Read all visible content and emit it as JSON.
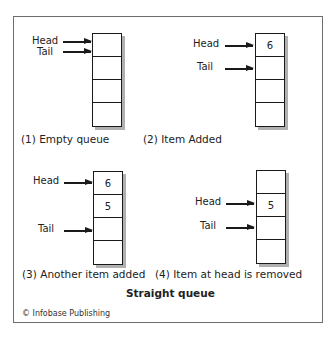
{
  "diagram": {
    "title": "Straight queue",
    "credit": "© Infobase Publishing",
    "panels": [
      {
        "caption": "(1) Empty queue",
        "head_label": "Head",
        "tail_label": "Tail",
        "cells": [
          "",
          "",
          "",
          ""
        ],
        "head_index": 0,
        "tail_index": 0
      },
      {
        "caption": "(2) Item Added",
        "head_label": "Head",
        "tail_label": "Tail",
        "cells": [
          "6",
          "",
          "",
          ""
        ],
        "head_index": 0,
        "tail_index": 1
      },
      {
        "caption": "(3) Another item added",
        "head_label": "Head",
        "tail_label": "Tail",
        "cells": [
          "6",
          "5",
          "",
          ""
        ],
        "head_index": 0,
        "tail_index": 2
      },
      {
        "caption": "(4) Item at head is removed",
        "head_label": "Head",
        "tail_label": "Tail",
        "cells": [
          "",
          "5",
          "",
          ""
        ],
        "head_index": 1,
        "tail_index": 2
      }
    ]
  }
}
